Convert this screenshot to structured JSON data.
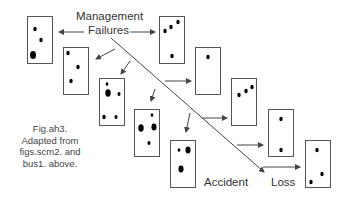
{
  "diagram": {
    "title_line1": "Management",
    "title_line2": "Failures",
    "label_accident": "Accident",
    "label_loss": "Loss",
    "caption": {
      "line1": "Fig.ah3.",
      "line2": "Adapted from",
      "line3": "figs.scm2. and",
      "line4": "bus1. above."
    },
    "colors": {
      "box_stroke": "#555555",
      "dot_fill": "#000000",
      "arrow": "#444444",
      "text": "#333333"
    },
    "boxes": [
      {
        "id": "A",
        "x": 27,
        "y": 16,
        "dots": [
          [
            35,
            29,
            2
          ],
          [
            41,
            40,
            2
          ],
          [
            33,
            55,
            3.5
          ]
        ]
      },
      {
        "id": "B",
        "x": 63,
        "y": 47,
        "dots": [
          [
            68,
            53,
            2
          ],
          [
            78,
            67,
            2
          ],
          [
            71,
            81,
            2
          ]
        ]
      },
      {
        "id": "C",
        "x": 99,
        "y": 78,
        "dots": [
          [
            107,
            84,
            1.6
          ],
          [
            108,
            93,
            3.2
          ],
          [
            119,
            94,
            1.8
          ],
          [
            104,
            117,
            2
          ],
          [
            116,
            117,
            1.8
          ]
        ]
      },
      {
        "id": "D",
        "x": 134,
        "y": 109,
        "dots": [
          [
            152,
            115,
            1.6
          ],
          [
            141,
            128,
            3.2
          ],
          [
            154,
            127,
            3
          ],
          [
            149,
            143,
            1.8
          ]
        ]
      },
      {
        "id": "E",
        "x": 170,
        "y": 140,
        "dots": [
          [
            179,
            150,
            1.6
          ],
          [
            188,
            150,
            3
          ],
          [
            181,
            169,
            3
          ]
        ]
      },
      {
        "id": "F",
        "x": 159,
        "y": 16,
        "dots": [
          [
            165,
            31,
            2
          ],
          [
            171,
            27,
            2
          ],
          [
            178,
            22,
            2
          ],
          [
            172,
            56,
            2
          ]
        ]
      },
      {
        "id": "G",
        "x": 195,
        "y": 47,
        "dots": [
          [
            208,
            57,
            2
          ]
        ]
      },
      {
        "id": "H",
        "x": 231,
        "y": 78,
        "dots": [
          [
            239,
            95,
            2
          ],
          [
            246,
            91,
            2
          ],
          [
            252,
            87,
            2
          ]
        ]
      },
      {
        "id": "I",
        "x": 268,
        "y": 109,
        "dots": [
          [
            281,
            119,
            2
          ],
          [
            281,
            150,
            2
          ]
        ]
      },
      {
        "id": "J",
        "x": 305,
        "y": 140,
        "dots": [
          [
            317,
            150,
            2
          ],
          [
            322,
            174,
            2
          ],
          [
            311,
            182,
            2
          ]
        ]
      }
    ]
  }
}
